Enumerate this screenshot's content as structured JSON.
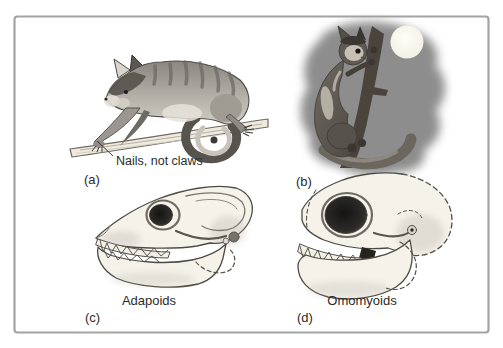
{
  "panels": {
    "a": {
      "tag": "(a)",
      "annotation": "Nails, not claws"
    },
    "b": {
      "tag": "(b)"
    },
    "c": {
      "tag": "(c)",
      "caption": "Adapoids"
    },
    "d": {
      "tag": "(d)",
      "caption": "Omomyoids"
    }
  },
  "colors": {
    "background": "#ffffff",
    "frame_border": "#a3a3a3",
    "text": "#2b2b2b",
    "night_blob": "#8d8d8d",
    "moon": "#fbfaf2",
    "skull_fill": "#f5f2ea",
    "skull_stroke": "#4f4b44",
    "orbit_dark": "#141414"
  }
}
